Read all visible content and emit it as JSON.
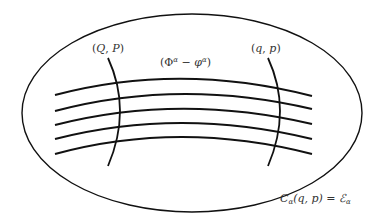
{
  "diagram": {
    "colors": {
      "stroke": "#111111",
      "label": "#333333",
      "background": "#ffffff"
    },
    "region": {
      "shape": "ellipse",
      "cx": 192,
      "cy": 113,
      "rx": 170,
      "ry": 99
    },
    "orbits": [
      {
        "d": "M55,95 Q180,62 312,96"
      },
      {
        "d": "M55,111 Q180,78 312,109"
      },
      {
        "d": "M55,125 Q180,93 312,124"
      },
      {
        "d": "M55,139 Q180,107 312,139"
      },
      {
        "d": "M55,154 Q180,120 312,154"
      }
    ],
    "sections": [
      {
        "name": "QP-section",
        "d": "M108,58 Q132,110 108,166"
      },
      {
        "name": "qp-section",
        "d": "M268,58 Q292,110 268,166"
      }
    ],
    "labels": {
      "QP": {
        "open": "(",
        "a": "Q",
        "sep": ", ",
        "b": "P",
        "close": ")"
      },
      "gauge": {
        "open": "(",
        "Phi": "Φ",
        "sup1": "α",
        "minus": " − ",
        "phi": "φ",
        "sup2": "α",
        "close": ")"
      },
      "qp": {
        "open": "(",
        "a": "q",
        "sep": ", ",
        "b": "p",
        "close": ")"
      },
      "constraint": {
        "C": "C",
        "sub1": "α",
        "args": "(q, p)",
        "eq": " = ",
        "E": "ℰ",
        "sub2": "α"
      }
    }
  }
}
